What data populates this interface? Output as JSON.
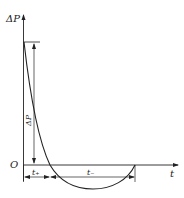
{
  "diagram": {
    "type": "pressure-time curve",
    "y_axis_label": "ΔP",
    "x_axis_label": "t",
    "origin_label": "O",
    "amplitude_label": "ΔP",
    "positive_phase_label": "t₊",
    "negative_phase_label": "t₋",
    "colors": {
      "line": "#222222",
      "background": "#ffffff"
    }
  }
}
